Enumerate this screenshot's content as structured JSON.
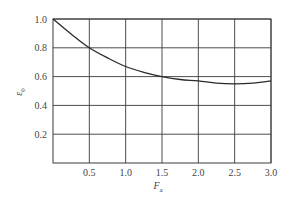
{
  "chart_data": {
    "type": "line",
    "title": "",
    "xlabel": "F_a",
    "ylabel": "ε_0",
    "xlabel_main": "F",
    "xlabel_sub": "a",
    "ylabel_main": "ε",
    "ylabel_sub": "0",
    "xlim": [
      0,
      3.0
    ],
    "ylim": [
      0,
      1.0
    ],
    "x_ticks": [
      "0.5",
      "1.0",
      "1.5",
      "2.0",
      "2.5",
      "3.0"
    ],
    "y_ticks": [
      "0.2",
      "0.4",
      "0.6",
      "0.8",
      "1.0"
    ],
    "grid": true,
    "legend": null,
    "series": [
      {
        "name": "ε0 vs Fa",
        "x": [
          0,
          0.25,
          0.5,
          0.75,
          1.0,
          1.25,
          1.5,
          1.75,
          2.0,
          2.25,
          2.5,
          2.75,
          3.0
        ],
        "values": [
          1.0,
          0.895,
          0.8,
          0.73,
          0.67,
          0.63,
          0.6,
          0.58,
          0.57,
          0.555,
          0.55,
          0.555,
          0.57
        ]
      }
    ]
  },
  "labels": {
    "x_ticks": [
      "0.5",
      "1.0",
      "1.5",
      "2.0",
      "2.5",
      "3.0"
    ],
    "y_ticks": [
      "0.2",
      "0.4",
      "0.6",
      "0.8",
      "1.0"
    ],
    "xlabel_main": "F",
    "xlabel_sub": "a",
    "ylabel_main": "ε",
    "ylabel_sub": "0"
  },
  "colors": {
    "grid": "#3a3a3a",
    "curve": "#2a2a2a",
    "text": "#444444"
  }
}
